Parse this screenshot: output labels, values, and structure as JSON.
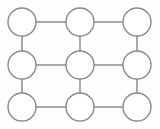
{
  "figure": {
    "title": "",
    "kind": "node-link-diagram",
    "background_color": "#fefefe",
    "width": 160,
    "height": 129
  },
  "style": {
    "node_fill": "#ffffff",
    "node_stroke": "#8a8a8a",
    "node_stroke_width": 1.4,
    "node_radius": 14,
    "edge_stroke": "#848484",
    "edge_stroke_width": 1.4
  },
  "chart_data": {
    "type": "graph",
    "title": "",
    "xlabel": "",
    "ylabel": "",
    "grid": false,
    "legend": false,
    "node_count": 9,
    "edge_count": 12,
    "columns_x": [
      22,
      80,
      137
    ],
    "rows_y": [
      22,
      65,
      107
    ],
    "nodes": [
      {
        "id": "n00",
        "label": "",
        "row": 0,
        "col": 0,
        "cx": 22,
        "cy": 22,
        "r": 14
      },
      {
        "id": "n01",
        "label": "",
        "row": 0,
        "col": 1,
        "cx": 80,
        "cy": 22,
        "r": 14
      },
      {
        "id": "n02",
        "label": "",
        "row": 0,
        "col": 2,
        "cx": 137,
        "cy": 22,
        "r": 14
      },
      {
        "id": "n10",
        "label": "",
        "row": 1,
        "col": 0,
        "cx": 22,
        "cy": 65,
        "r": 14
      },
      {
        "id": "n11",
        "label": "",
        "row": 1,
        "col": 1,
        "cx": 80,
        "cy": 65,
        "r": 14
      },
      {
        "id": "n12",
        "label": "",
        "row": 1,
        "col": 2,
        "cx": 137,
        "cy": 65,
        "r": 14
      },
      {
        "id": "n20",
        "label": "",
        "row": 2,
        "col": 0,
        "cx": 22,
        "cy": 107,
        "r": 14
      },
      {
        "id": "n21",
        "label": "",
        "row": 2,
        "col": 1,
        "cx": 80,
        "cy": 107,
        "r": 14
      },
      {
        "id": "n22",
        "label": "",
        "row": 2,
        "col": 2,
        "cx": 137,
        "cy": 107,
        "r": 14
      }
    ],
    "edges": [
      {
        "id": "e-n00-n01",
        "source": "n00",
        "target": "n01",
        "orientation": "horizontal",
        "x1": 36,
        "y1": 22,
        "x2": 66,
        "y2": 22
      },
      {
        "id": "e-n01-n02",
        "source": "n01",
        "target": "n02",
        "orientation": "horizontal",
        "x1": 94,
        "y1": 22,
        "x2": 123,
        "y2": 22
      },
      {
        "id": "e-n10-n11",
        "source": "n10",
        "target": "n11",
        "orientation": "horizontal",
        "x1": 36,
        "y1": 65,
        "x2": 66,
        "y2": 65
      },
      {
        "id": "e-n11-n12",
        "source": "n11",
        "target": "n12",
        "orientation": "horizontal",
        "x1": 94,
        "y1": 65,
        "x2": 123,
        "y2": 65
      },
      {
        "id": "e-n20-n21",
        "source": "n20",
        "target": "n21",
        "orientation": "horizontal",
        "x1": 36,
        "y1": 107,
        "x2": 66,
        "y2": 107
      },
      {
        "id": "e-n21-n22",
        "source": "n21",
        "target": "n22",
        "orientation": "horizontal",
        "x1": 94,
        "y1": 107,
        "x2": 123,
        "y2": 107
      },
      {
        "id": "e-n00-n10",
        "source": "n00",
        "target": "n10",
        "orientation": "vertical",
        "x1": 22,
        "y1": 36,
        "x2": 22,
        "y2": 51
      },
      {
        "id": "e-n10-n20",
        "source": "n10",
        "target": "n20",
        "orientation": "vertical",
        "x1": 22,
        "y1": 79,
        "x2": 22,
        "y2": 93
      },
      {
        "id": "e-n01-n11",
        "source": "n01",
        "target": "n11",
        "orientation": "vertical",
        "x1": 80,
        "y1": 36,
        "x2": 80,
        "y2": 51
      },
      {
        "id": "e-n11-n21",
        "source": "n11",
        "target": "n21",
        "orientation": "vertical",
        "x1": 80,
        "y1": 79,
        "x2": 80,
        "y2": 93
      },
      {
        "id": "e-n02-n12",
        "source": "n02",
        "target": "n12",
        "orientation": "vertical",
        "x1": 137,
        "y1": 36,
        "x2": 137,
        "y2": 51
      },
      {
        "id": "e-n12-n22",
        "source": "n12",
        "target": "n22",
        "orientation": "vertical",
        "x1": 137,
        "y1": 79,
        "x2": 137,
        "y2": 93
      }
    ]
  }
}
